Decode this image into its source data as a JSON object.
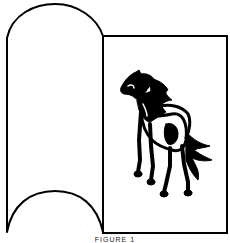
{
  "figure": {
    "caption": "FIGURE 1",
    "stroke_color": "#000000",
    "background": "#ffffff",
    "elements": [
      {
        "name": "arched-panel",
        "shape": "panel with convex top arch and concave bottom arch"
      },
      {
        "name": "rectangular-panel",
        "shape": "rectangle"
      },
      {
        "name": "horse-illustration",
        "subject": "horse"
      }
    ]
  }
}
